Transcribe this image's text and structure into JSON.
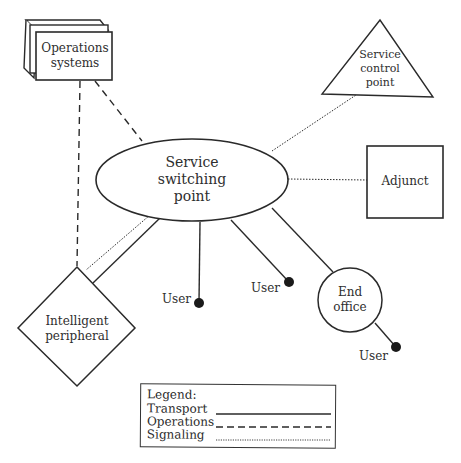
{
  "diagram": {
    "nodes": {
      "operations_systems": {
        "line1": "Operations",
        "line2": "systems",
        "shape": "stacked-box"
      },
      "service_control_point": {
        "line1": "Service",
        "line2": "control",
        "line3": "point",
        "shape": "triangle"
      },
      "service_switching_point": {
        "line1": "Service",
        "line2": "switching",
        "line3": "point",
        "shape": "ellipse"
      },
      "adjunct": {
        "label": "Adjunct",
        "shape": "box"
      },
      "intelligent_peripheral": {
        "line1": "Intelligent",
        "line2": "peripheral",
        "shape": "diamond"
      },
      "end_office": {
        "line1": "End",
        "line2": "office",
        "shape": "circle"
      },
      "users": [
        {
          "label": "User"
        },
        {
          "label": "User"
        },
        {
          "label": "User"
        }
      ]
    },
    "edges": [
      {
        "from": "Operations systems",
        "to": "Intelligent peripheral",
        "type": "Operations"
      },
      {
        "from": "Operations systems",
        "to": "Service switching point",
        "type": "Operations"
      },
      {
        "from": "Service switching point",
        "to": "Service control point",
        "type": "Signaling"
      },
      {
        "from": "Service switching point",
        "to": "Adjunct",
        "type": "Signaling"
      },
      {
        "from": "Service switching point",
        "to": "Intelligent peripheral",
        "type": "Signaling"
      },
      {
        "from": "Service switching point",
        "to": "Intelligent peripheral",
        "type": "Transport"
      },
      {
        "from": "Service switching point",
        "to": "User",
        "type": "Transport"
      },
      {
        "from": "Service switching point",
        "to": "User",
        "type": "Transport"
      },
      {
        "from": "Service switching point",
        "to": "End office",
        "type": "Transport"
      },
      {
        "from": "End office",
        "to": "User",
        "type": "Transport"
      }
    ],
    "legend": {
      "title": "Legend:",
      "items": [
        {
          "label": "Transport",
          "style": "solid"
        },
        {
          "label": "Operations",
          "style": "dashed"
        },
        {
          "label": "Signaling",
          "style": "dotted"
        }
      ]
    },
    "colors": {
      "line": "#2a2a2a",
      "background": "#ffffff"
    }
  }
}
